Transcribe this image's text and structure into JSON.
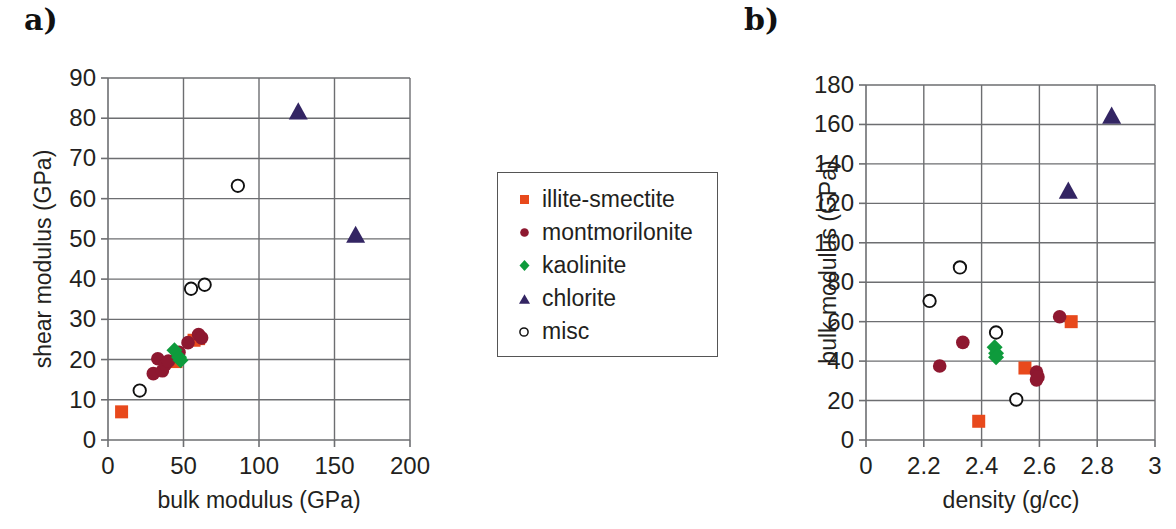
{
  "figure": {
    "panel_a_label": "a)",
    "panel_b_label": "b)"
  },
  "legend": {
    "items": [
      {
        "label": "illite-smectite",
        "marker": "square",
        "color": "#E8491C",
        "icon": "square-marker-icon"
      },
      {
        "label": "montmorilonite",
        "marker": "circle",
        "color": "#8E1830",
        "icon": "circle-marker-icon"
      },
      {
        "label": "kaolinite",
        "marker": "diamond",
        "color": "#0E9B3C",
        "icon": "diamond-marker-icon"
      },
      {
        "label": "chlorite",
        "marker": "triangle",
        "color": "#332563",
        "icon": "triangle-marker-icon"
      },
      {
        "label": "misc",
        "marker": "open-circle",
        "color": "#FFFFFF",
        "icon": "open-circle-marker-icon"
      }
    ]
  },
  "chart_data": [
    {
      "id": "panel-a",
      "type": "scatter",
      "title": "",
      "xlabel": "bulk modulus (GPa)",
      "ylabel": "shear modulus (GPa)",
      "xlim": [
        0,
        200
      ],
      "ylim": [
        0,
        90
      ],
      "xticks": [
        0,
        50,
        100,
        150,
        200
      ],
      "xtick_labels": [
        "0",
        "50",
        "100",
        "150",
        "200"
      ],
      "yticks": [
        0,
        10,
        20,
        30,
        40,
        50,
        60,
        70,
        80,
        90
      ],
      "ytick_labels": [
        "0",
        "10",
        "20",
        "30",
        "40",
        "50",
        "60",
        "70",
        "80",
        "90"
      ],
      "grid": true,
      "axis_broken": false,
      "series": [
        {
          "name": "illite-smectite",
          "marker": "square",
          "color": "#E8491C",
          "points": [
            [
              9,
              7
            ],
            [
              45,
              19.5
            ],
            [
              57,
              24.8
            ],
            [
              60,
              25.2
            ]
          ]
        },
        {
          "name": "montmorilonite",
          "marker": "circle",
          "color": "#8E1830",
          "points": [
            [
              30,
              16.5
            ],
            [
              33,
              20.2
            ],
            [
              36,
              17.2
            ],
            [
              38,
              18.8
            ],
            [
              40,
              19.6
            ],
            [
              47,
              21.8
            ],
            [
              53,
              24.2
            ],
            [
              60,
              26.2
            ],
            [
              62,
              25.4
            ]
          ]
        },
        {
          "name": "kaolinite",
          "marker": "diamond",
          "color": "#0E9B3C",
          "points": [
            [
              44,
              22.3
            ],
            [
              47,
              20.6
            ],
            [
              48,
              19.8
            ]
          ]
        },
        {
          "name": "chlorite",
          "marker": "triangle",
          "color": "#332563",
          "points": [
            [
              126,
              81.5
            ],
            [
              164,
              50.8
            ]
          ]
        },
        {
          "name": "misc",
          "marker": "open-circle",
          "color": "#FFFFFF",
          "points": [
            [
              21,
              12.3
            ],
            [
              55,
              37.6
            ],
            [
              64,
              38.6
            ],
            [
              86,
              63.2
            ]
          ]
        }
      ]
    },
    {
      "id": "panel-b",
      "type": "scatter",
      "title": "",
      "xlabel": "density (g/cc)",
      "ylabel": "bulk modulus (GPa)",
      "xlim": [
        0,
        3
      ],
      "ylim": [
        0,
        180
      ],
      "xticks": [
        0,
        2.2,
        2.4,
        2.6,
        2.8,
        3
      ],
      "xtick_labels": [
        "0",
        "2.2",
        "2.4",
        "2.6",
        "2.8",
        "3"
      ],
      "yticks": [
        0,
        20,
        40,
        60,
        80,
        100,
        120,
        140,
        160,
        180
      ],
      "ytick_labels": [
        "0",
        "20",
        "40",
        "60",
        "80",
        "100",
        "120",
        "140",
        "160",
        "180"
      ],
      "grid": true,
      "axis_broken": true,
      "series": [
        {
          "name": "illite-smectite",
          "marker": "square",
          "color": "#E8491C",
          "points": [
            [
              2.39,
              9.5
            ],
            [
              2.55,
              36.5
            ],
            [
              2.71,
              60
            ]
          ]
        },
        {
          "name": "montmorilonite",
          "marker": "circle",
          "color": "#8E1830",
          "points": [
            [
              2.255,
              37.5
            ],
            [
              2.335,
              49.5
            ],
            [
              2.59,
              34.5
            ],
            [
              2.59,
              30.5
            ],
            [
              2.595,
              32
            ],
            [
              2.67,
              62.5
            ]
          ]
        },
        {
          "name": "kaolinite",
          "marker": "diamond",
          "color": "#0E9B3C",
          "points": [
            [
              2.445,
              47
            ],
            [
              2.45,
              44
            ],
            [
              2.45,
              42
            ]
          ]
        },
        {
          "name": "chlorite",
          "marker": "triangle",
          "color": "#332563",
          "points": [
            [
              2.85,
              164
            ],
            [
              2.7,
              126
            ]
          ]
        },
        {
          "name": "misc",
          "marker": "open-circle",
          "color": "#FFFFFF",
          "points": [
            [
              2.22,
              70.5
            ],
            [
              2.325,
              87.5
            ],
            [
              2.45,
              54.5
            ],
            [
              2.52,
              20.5
            ]
          ]
        }
      ]
    }
  ]
}
